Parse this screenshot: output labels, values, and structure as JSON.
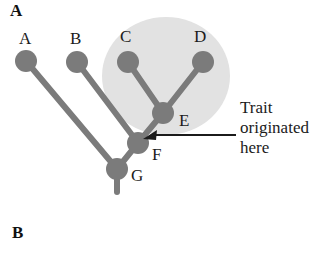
{
  "figure": {
    "panels": [
      {
        "id": "A",
        "label": "A"
      },
      {
        "id": "B",
        "label": "B"
      }
    ],
    "colors": {
      "node_fill": "#7b7b7b",
      "branch_stroke": "#7b7b7b",
      "clade_highlight": "#e2e2e2",
      "text": "#1b1b1b",
      "arrow": "#1b1b1b",
      "background": "#ffffff"
    },
    "annotation": {
      "line1": "Trait",
      "line2": "originated",
      "line3": "here",
      "points_to": "F",
      "arrow_name": "trait-origin-arrow"
    },
    "clade_highlight": {
      "name": "clade-highlight-circle",
      "members": [
        "C",
        "D",
        "E"
      ]
    },
    "tree": {
      "type": "phylogeny",
      "tips": [
        "A",
        "B",
        "C",
        "D"
      ],
      "internal_nodes": [
        "E",
        "F",
        "G"
      ],
      "root": "G",
      "edges": [
        {
          "from": "G",
          "to": "A"
        },
        {
          "from": "G",
          "to": "F"
        },
        {
          "from": "F",
          "to": "B"
        },
        {
          "from": "F",
          "to": "E"
        },
        {
          "from": "E",
          "to": "C"
        },
        {
          "from": "E",
          "to": "D"
        },
        {
          "from": "G",
          "to": "root-stem"
        }
      ],
      "nodes": [
        {
          "id": "A",
          "label": "A",
          "x": 26,
          "y": 61,
          "r": 11,
          "label_x": 19,
          "label_y": 30
        },
        {
          "id": "B",
          "label": "B",
          "x": 77,
          "y": 62,
          "r": 11,
          "label_x": 70,
          "label_y": 30
        },
        {
          "id": "C",
          "label": "C",
          "x": 128,
          "y": 62,
          "r": 11,
          "label_x": 120,
          "label_y": 28
        },
        {
          "id": "D",
          "label": "D",
          "x": 203,
          "y": 62,
          "r": 11,
          "label_x": 194,
          "label_y": 28
        },
        {
          "id": "E",
          "label": "E",
          "x": 163,
          "y": 113,
          "r": 11,
          "label_x": 179,
          "label_y": 112
        },
        {
          "id": "F",
          "label": "F",
          "x": 138,
          "y": 143,
          "r": 11,
          "label_x": 152,
          "label_y": 146
        },
        {
          "id": "G",
          "label": "G",
          "x": 117,
          "y": 169,
          "r": 11,
          "label_x": 131,
          "label_y": 167
        }
      ]
    }
  }
}
